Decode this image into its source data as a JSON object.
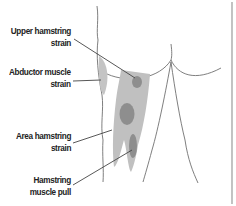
{
  "figure": {
    "colors": {
      "outline": "#707070",
      "light_shade": "#bdbdbd",
      "dark_shade": "#8e8e8e",
      "leader_line": "#444444",
      "border": "#9a9a9a",
      "text": "#222222"
    },
    "labels": [
      {
        "id": "upper-hamstring-strain",
        "line1": "Upper hamstring",
        "line2": "strain"
      },
      {
        "id": "abductor-muscle-strain",
        "line1": "Abductor muscle",
        "line2": "strain"
      },
      {
        "id": "area-hamstring-strain",
        "line1": "Area hamstring",
        "line2": "strain"
      },
      {
        "id": "hamstring-muscle-pull",
        "line1": "Hamstring",
        "line2": "muscle pull"
      }
    ]
  }
}
